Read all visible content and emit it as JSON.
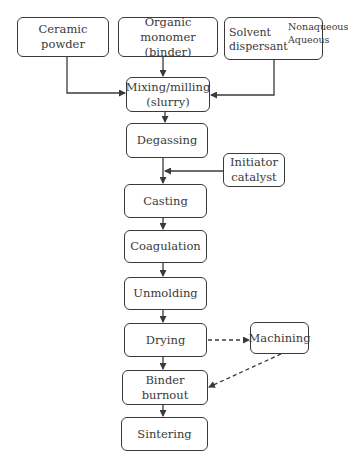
{
  "diagram": {
    "type": "flowchart",
    "title": "",
    "inputs": [
      {
        "id": "ceramic",
        "label": "Ceramic powder"
      },
      {
        "id": "monomer",
        "label_line1": "Organic monomer",
        "label_line2": "(binder)"
      },
      {
        "id": "solvent",
        "label_solvent": "Solvent",
        "label_dispersant": "dispersant",
        "branches": [
          "Nonaqueous",
          "Aqueous"
        ]
      }
    ],
    "steps": [
      {
        "id": "mixing",
        "label_line1": "Mixing/milling",
        "label_line2": "(slurry)"
      },
      {
        "id": "degassing",
        "label": "Degassing"
      },
      {
        "id": "casting",
        "label": "Casting"
      },
      {
        "id": "coagulation",
        "label": "Coagulation"
      },
      {
        "id": "unmolding",
        "label": "Unmolding"
      },
      {
        "id": "drying",
        "label": "Drying"
      },
      {
        "id": "binder_burnout",
        "label": "Binder burnout"
      },
      {
        "id": "sintering",
        "label": "Sintering"
      }
    ],
    "side_nodes": [
      {
        "id": "initiator",
        "label_line1": "Initiator",
        "label_line2": "catalyst"
      },
      {
        "id": "machining",
        "label": "Machining"
      }
    ],
    "edges": [
      {
        "from": "ceramic",
        "to": "mixing",
        "style": "solid"
      },
      {
        "from": "monomer",
        "to": "mixing",
        "style": "solid"
      },
      {
        "from": "solvent",
        "to": "mixing",
        "style": "solid"
      },
      {
        "from": "mixing",
        "to": "degassing",
        "style": "solid"
      },
      {
        "from": "degassing",
        "to": "casting",
        "style": "solid"
      },
      {
        "from": "initiator",
        "to": "degassing-casting-link",
        "style": "solid"
      },
      {
        "from": "casting",
        "to": "coagulation",
        "style": "solid"
      },
      {
        "from": "coagulation",
        "to": "unmolding",
        "style": "solid"
      },
      {
        "from": "unmolding",
        "to": "drying",
        "style": "solid"
      },
      {
        "from": "drying",
        "to": "binder_burnout",
        "style": "solid"
      },
      {
        "from": "drying",
        "to": "machining",
        "style": "dashed"
      },
      {
        "from": "machining",
        "to": "binder_burnout",
        "style": "dashed"
      },
      {
        "from": "binder_burnout",
        "to": "sintering",
        "style": "solid"
      }
    ],
    "colors": {
      "stroke": "#3a3a3a",
      "background": "#ffffff",
      "text": "#3a3a3a"
    }
  }
}
